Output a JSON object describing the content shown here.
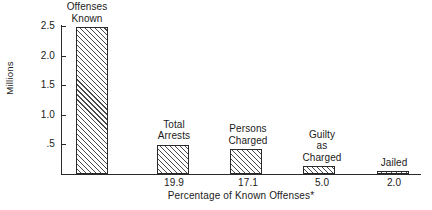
{
  "chart_data": {
    "type": "bar",
    "title": "",
    "subtitle": "",
    "xlabel": "Percentage of Known Offenses*",
    "ylabel": "Millions",
    "ylim": [
      0,
      2.65
    ],
    "grid": false,
    "legend": "none",
    "y_ticks": [
      {
        "label": ".5",
        "value": 0.5
      },
      {
        "label": "1.0",
        "value": 1.0
      },
      {
        "label": "1.5",
        "value": 1.5
      },
      {
        "label": "2.0",
        "value": 2.0
      },
      {
        "label": "2.5",
        "value": 2.5
      }
    ],
    "categories": [
      "Offenses\nKnown",
      "Total\nArrests",
      "Persons\nCharged",
      "Guilty\nas\nCharged",
      "Jailed"
    ],
    "values": [
      2.48,
      0.49,
      0.42,
      0.13,
      0.05
    ],
    "percent_labels": [
      "",
      "19.9",
      "17.1",
      "5.0",
      "2.0"
    ],
    "bars": [
      {
        "label": "Offenses\nKnown",
        "value": 2.48,
        "percent_label": "",
        "label_left": 45,
        "label_width": 84,
        "label_top": 2,
        "bar_left": 76,
        "bar_width": 32,
        "bar_top": 26
      },
      {
        "label": "Total\nArrests",
        "value": 0.49,
        "percent_label": "19.9",
        "label_left": 141,
        "label_width": 66,
        "label_top": 119,
        "bar_left": 157,
        "bar_width": 32,
        "bar_top": 145
      },
      {
        "label": "Persons\nCharged",
        "value": 0.42,
        "percent_label": "17.1",
        "label_left": 213,
        "label_width": 70,
        "label_top": 119,
        "bar_left": 230,
        "bar_width": 32,
        "bar_top": 149
      },
      {
        "label": "Guilty\nas\nCharged",
        "value": 0.13,
        "percent_label": "5.0",
        "label_left": 287,
        "label_width": 70,
        "label_top": 119,
        "bar_left": 303,
        "bar_width": 32,
        "bar_top": 166
      },
      {
        "label": "Jailed",
        "value": 0.05,
        "percent_label": "2.0",
        "label_left": 361,
        "label_width": 66,
        "label_top": 155,
        "bar_left": 377,
        "bar_width": 32,
        "bar_top": 170
      }
    ]
  }
}
